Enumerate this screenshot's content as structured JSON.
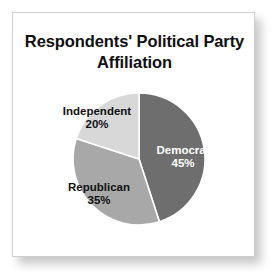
{
  "chart_data": {
    "type": "pie",
    "title": "Respondents' Political Party Affiliation",
    "title_line1": "Respondents' Political",
    "title_line2": "Party Affiliation",
    "xlabel": "",
    "ylabel": "",
    "legend": "none",
    "grid": false,
    "start_angle_deg": 0,
    "direction": "clockwise",
    "categories": [
      "Democrat",
      "Republican",
      "Independent"
    ],
    "values": [
      45,
      35,
      20
    ],
    "value_unit": "%",
    "slices": [
      {
        "label": "Democrat",
        "value": 45,
        "value_text": "45%",
        "color": "#6e6e6e",
        "text_color": "#ffffff",
        "sweep_deg": 162,
        "label_position": "inside"
      },
      {
        "label": "Republican",
        "value": 35,
        "value_text": "35%",
        "color": "#a8a8a8",
        "text_color": "#111111",
        "sweep_deg": 126,
        "label_position": "inside"
      },
      {
        "label": "Independent",
        "value": 20,
        "value_text": "20%",
        "color": "#d8d8d8",
        "text_color": "#111111",
        "sweep_deg": 72,
        "label_position": "outside"
      }
    ]
  },
  "figure": {
    "card_background": "#ffffff",
    "card_border_color": "#cfcfcf",
    "page_background": "#ffffff",
    "slice_separator_color": "#ffffff",
    "pie_center_x": 126,
    "pie_center_y": 146,
    "pie_radius": 66
  }
}
